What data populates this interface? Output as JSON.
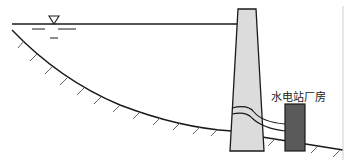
{
  "diagram": {
    "labels": {
      "powerhouse": "水电站厂房"
    },
    "symbols": {
      "water_level": "water-level-triangle"
    },
    "colors": {
      "dam_fill": "#dcdcdc",
      "powerhouse_fill": "#5a5a5a",
      "line": "#1a1a1a",
      "hatch": "#555555"
    }
  }
}
